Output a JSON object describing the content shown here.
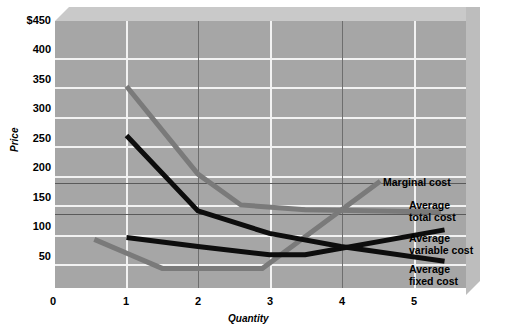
{
  "chart_data": {
    "type": "line",
    "title": "",
    "xlabel": "Quantity",
    "ylabel": "Price",
    "xlim": [
      0,
      5.75
    ],
    "ylim": [
      0,
      450
    ],
    "xticks": [
      0,
      1,
      2,
      3,
      4,
      5
    ],
    "xtick_labels": [
      "0",
      "1",
      "2",
      "3",
      "4",
      "5"
    ],
    "yticks": [
      0,
      50,
      100,
      150,
      200,
      250,
      300,
      350,
      400,
      450
    ],
    "ytick_labels": [
      "0",
      "50",
      "100",
      "150",
      "200",
      "250",
      "300",
      "350",
      "400",
      "$450"
    ],
    "grid": true,
    "legend_position": "right-inline-callouts",
    "plot_bgcolor": "#a6a6a6",
    "gridline_color": "#f2f2f2",
    "reference_lines": [
      {
        "name": "upper-reference-line",
        "y": 185,
        "color": "#5a5a5a"
      },
      {
        "name": "lower-reference-line",
        "y": 128,
        "color": "#5a5a5a"
      }
    ],
    "series": [
      {
        "name": "Marginal cost",
        "color": "#7a7a7a",
        "width": 5,
        "label": "Marginal\ncost",
        "points": [
          [
            0.55,
            82
          ],
          [
            1.5,
            33
          ],
          [
            2.9,
            33
          ],
          [
            4.55,
            180
          ]
        ]
      },
      {
        "name": "Average total cost",
        "color": "#7a7a7a",
        "width": 5,
        "label": "Average\ntotal cost",
        "points": [
          [
            1.0,
            340
          ],
          [
            2.0,
            192
          ],
          [
            2.6,
            140
          ],
          [
            3.5,
            132
          ],
          [
            5.4,
            128
          ]
        ]
      },
      {
        "name": "Average variable cost",
        "color": "#0d0d0d",
        "width": 5,
        "label": "Average\nvariable cost",
        "points": [
          [
            1.0,
            85
          ],
          [
            2.0,
            70
          ],
          [
            3.0,
            56
          ],
          [
            3.5,
            56
          ],
          [
            5.45,
            98
          ]
        ]
      },
      {
        "name": "Average fixed cost",
        "color": "#0d0d0d",
        "width": 5,
        "label": "Average\nfixed cost",
        "points": [
          [
            1.0,
            257
          ],
          [
            2.0,
            130
          ],
          [
            3.0,
            92
          ],
          [
            4.0,
            70
          ],
          [
            5.45,
            45
          ]
        ]
      }
    ]
  },
  "callouts": {
    "marginal_cost": "Marginal cost",
    "average_total_cost": "Average\ntotal cost",
    "average_variable_cost": "Average\nvariable cost",
    "average_fixed_cost": "Average\nfixed cost"
  },
  "axes": {
    "y_title": "Price",
    "x_title": "Quantity",
    "y_labels": {
      "t450": "$450",
      "t400": "400",
      "t350": "350",
      "t300": "300",
      "t250": "250",
      "t200": "200",
      "t150": "150",
      "t100": "100",
      "t50": "50",
      "t0": "0"
    },
    "x_labels": {
      "t0": "0",
      "t1": "1",
      "t2": "2",
      "t3": "3",
      "t4": "4",
      "t5": "5"
    }
  }
}
